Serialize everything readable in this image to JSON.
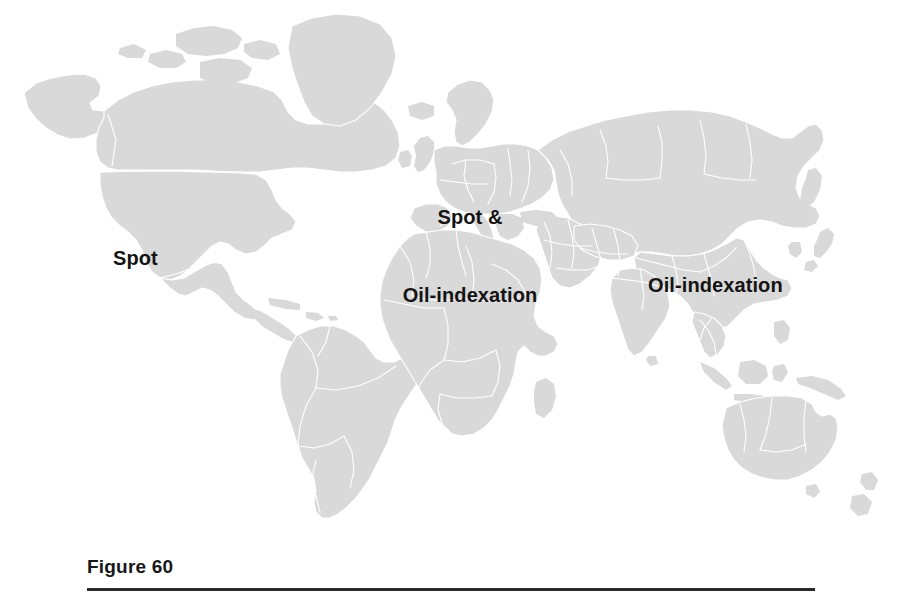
{
  "figure": {
    "caption": "Figure 60",
    "rule_color": "#2b2b2b"
  },
  "map": {
    "background_color": "#ffffff",
    "land_fill_color": "#d9d9d9",
    "border_color": "#ffffff",
    "label_color": "#141414",
    "projection_note": "world map, equirectangular-style outline"
  },
  "labels": {
    "americas": {
      "text": "Spot",
      "region": "North America"
    },
    "europe": {
      "line1": "Spot &",
      "line2": "Oil-indexation",
      "region": "Europe"
    },
    "asia": {
      "text": "Oil-indexation",
      "region": "Asia"
    }
  }
}
